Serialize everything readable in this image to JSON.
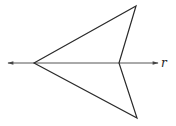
{
  "diagram": {
    "type": "geometry",
    "line": {
      "label": "r",
      "start": [
        8,
        63
      ],
      "end": [
        158,
        63
      ],
      "arrows": "both"
    },
    "shape": {
      "vertices": [
        [
          34,
          63
        ],
        [
          136,
          6
        ],
        [
          119,
          63
        ],
        [
          137,
          118
        ]
      ]
    },
    "colors": {
      "stroke": "#2a2a2a",
      "background": "#ffffff"
    }
  }
}
